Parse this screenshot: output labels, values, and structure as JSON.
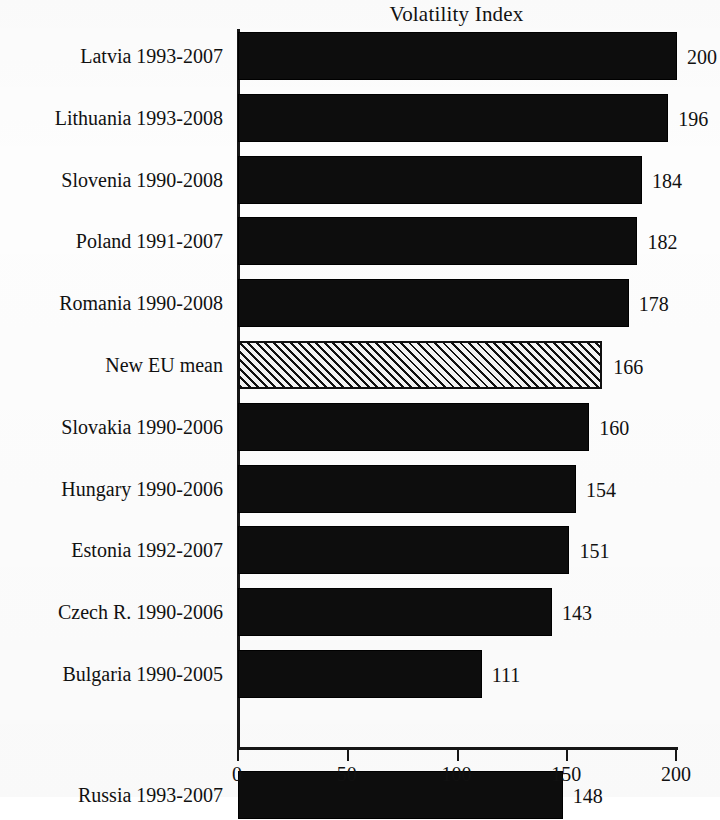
{
  "chart_data": {
    "type": "bar",
    "orientation": "horizontal",
    "title": "Volatility Index",
    "xlabel": "",
    "ylabel": "",
    "xlim": [
      0,
      200
    ],
    "xticks": [
      0,
      50,
      100,
      150,
      200
    ],
    "xtick_labels": [
      "0",
      "50",
      "100",
      "150",
      "200"
    ],
    "grid": false,
    "legend": false,
    "categories": [
      "Latvia 1993-2007",
      "Lithuania 1993-2008",
      "Slovenia 1990-2008",
      "Poland 1991-2007",
      "Romania 1990-2008",
      "New EU mean",
      "Slovakia 1990-2006",
      "Hungary 1990-2006",
      "Estonia 1992-2007",
      "Czech R. 1990-2006",
      "Bulgaria 1990-2005",
      "Russia 1993-2007"
    ],
    "values": [
      200,
      196,
      184,
      182,
      178,
      166,
      160,
      154,
      151,
      143,
      111,
      148
    ],
    "bars": [
      {
        "label": "Latvia 1993-2007",
        "value": 200,
        "value_label": "200",
        "style": "solid",
        "row": 0
      },
      {
        "label": "Lithuania 1993-2008",
        "value": 196,
        "value_label": "196",
        "style": "solid",
        "row": 1
      },
      {
        "label": "Slovenia 1990-2008",
        "value": 184,
        "value_label": "184",
        "style": "solid",
        "row": 2
      },
      {
        "label": "Poland 1991-2007",
        "value": 182,
        "value_label": "182",
        "style": "solid",
        "row": 3
      },
      {
        "label": "Romania 1990-2008",
        "value": 178,
        "value_label": "178",
        "style": "solid",
        "row": 4
      },
      {
        "label": "New EU mean",
        "value": 166,
        "value_label": "166",
        "style": "hatched",
        "row": 5
      },
      {
        "label": "Slovakia 1990-2006",
        "value": 160,
        "value_label": "160",
        "style": "solid",
        "row": 6
      },
      {
        "label": "Hungary 1990-2006",
        "value": 154,
        "value_label": "154",
        "style": "solid",
        "row": 7
      },
      {
        "label": "Estonia 1992-2007",
        "value": 151,
        "value_label": "151",
        "style": "solid",
        "row": 8
      },
      {
        "label": "Czech R. 1990-2006",
        "value": 143,
        "value_label": "143",
        "style": "solid",
        "row": 9
      },
      {
        "label": "Bulgaria 1990-2005",
        "value": 111,
        "value_label": "111",
        "style": "solid",
        "row": 10
      },
      {
        "label": "Russia 1993-2007",
        "value": 148,
        "value_label": "148",
        "style": "solid",
        "row": 11.95
      }
    ],
    "colors": {
      "bar_fill": "#0d0d0d",
      "mean_bar_fill": "#f2f2f2",
      "mean_bar_hatch": "#111111",
      "axis": "#161616",
      "text": "#111111",
      "background": "#fdfdfd"
    }
  }
}
